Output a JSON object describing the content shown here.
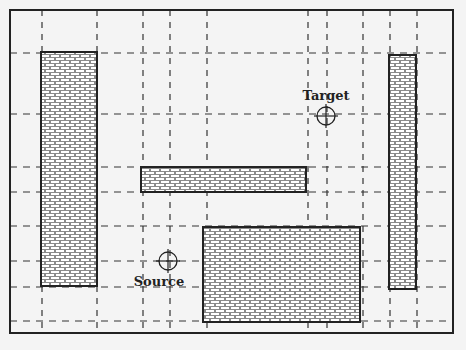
{
  "diagram": {
    "type": "path-planning-grid",
    "border": {
      "x": 10,
      "y": 10,
      "w": 443,
      "h": 323
    },
    "colors": {
      "background": "#f4f4f4",
      "line": "#222222",
      "mortar": "#8a8a8a",
      "brick": "#ffffff"
    },
    "obstacles": [
      {
        "id": "obstacle-left",
        "x": 41,
        "y": 52,
        "w": 56,
        "h": 234
      },
      {
        "id": "obstacle-middle-bar",
        "x": 141,
        "y": 167,
        "w": 165,
        "h": 25
      },
      {
        "id": "obstacle-bottom-block",
        "x": 203,
        "y": 227,
        "w": 157,
        "h": 95
      },
      {
        "id": "obstacle-right",
        "x": 389,
        "y": 55,
        "w": 27,
        "h": 234
      }
    ],
    "source": {
      "label": "Source",
      "cx": 168,
      "cy": 261,
      "r": 9,
      "label_x": 159,
      "label_y": 286
    },
    "target": {
      "label": "Target",
      "cx": 326,
      "cy": 116,
      "r": 9,
      "label_x": 326,
      "label_y": 100
    },
    "grid": {
      "vertical_x": [
        42,
        97,
        143,
        170,
        207,
        308,
        327,
        363,
        390,
        417
      ],
      "horizontal_y": [
        53,
        114,
        167,
        192,
        226,
        261,
        287,
        321
      ]
    }
  }
}
